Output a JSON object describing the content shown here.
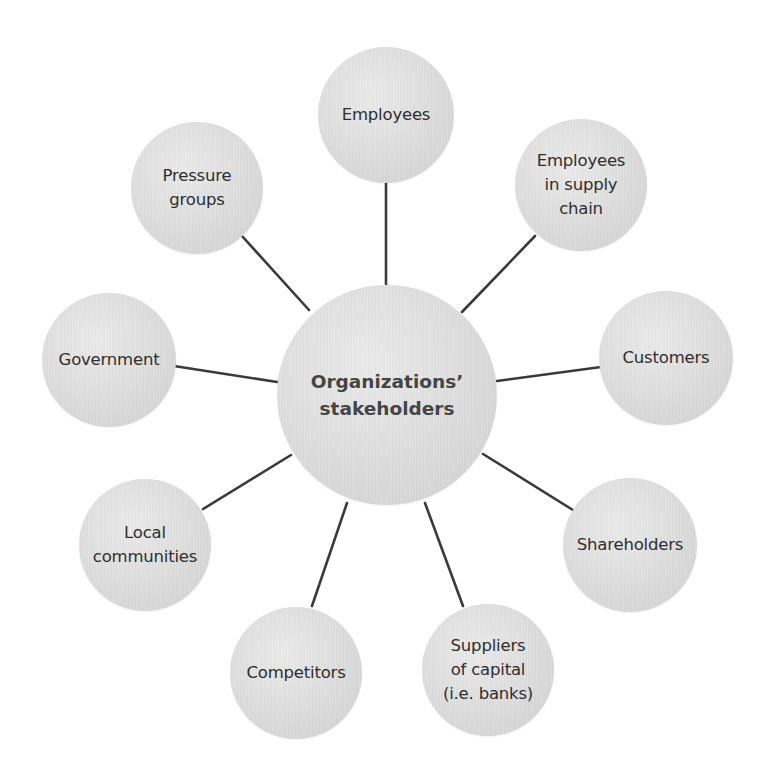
{
  "diagram": {
    "center": {
      "label": "Organizations’\nstakeholders",
      "cx": 387,
      "cy": 395,
      "r": 110
    },
    "nodes": [
      {
        "id": "employees",
        "label": "Employees",
        "cx": 386,
        "cy": 115,
        "r": 68
      },
      {
        "id": "employees-in-supply-chain",
        "label": "Employees\nin supply\nchain",
        "cx": 581,
        "cy": 185,
        "r": 66
      },
      {
        "id": "customers",
        "label": "Customers",
        "cx": 666,
        "cy": 358,
        "r": 67
      },
      {
        "id": "shareholders",
        "label": "Shareholders",
        "cx": 630,
        "cy": 545,
        "r": 67
      },
      {
        "id": "suppliers-of-capital",
        "label": "Suppliers\nof capital\n(i.e. banks)",
        "cx": 488,
        "cy": 670,
        "r": 66
      },
      {
        "id": "competitors",
        "label": "Competitors",
        "cx": 296,
        "cy": 673,
        "r": 66
      },
      {
        "id": "local-communities",
        "label": "Local\ncommunities",
        "cx": 145,
        "cy": 545,
        "r": 66
      },
      {
        "id": "government",
        "label": "Government",
        "cx": 109,
        "cy": 360,
        "r": 67
      },
      {
        "id": "pressure-groups",
        "label": "Pressure\ngroups",
        "cx": 197,
        "cy": 188,
        "r": 66
      }
    ],
    "edges": [
      {
        "to": "employees",
        "x1": 386,
        "y1": 284,
        "x2": 386,
        "y2": 182
      },
      {
        "to": "employees-in-supply-chain",
        "x1": 462,
        "y1": 312,
        "x2": 535,
        "y2": 236
      },
      {
        "to": "customers",
        "x1": 497,
        "y1": 381,
        "x2": 601,
        "y2": 367
      },
      {
        "to": "shareholders",
        "x1": 483,
        "y1": 454,
        "x2": 573,
        "y2": 510
      },
      {
        "to": "suppliers-of-capital",
        "x1": 425,
        "y1": 503,
        "x2": 463,
        "y2": 606
      },
      {
        "to": "competitors",
        "x1": 347,
        "y1": 503,
        "x2": 312,
        "y2": 606
      },
      {
        "to": "local-communities",
        "x1": 291,
        "y1": 455,
        "x2": 203,
        "y2": 509
      },
      {
        "to": "government",
        "x1": 277,
        "y1": 382,
        "x2": 174,
        "y2": 366
      },
      {
        "to": "pressure-groups",
        "x1": 309,
        "y1": 310,
        "x2": 242,
        "y2": 236
      }
    ],
    "colors": {
      "line": "#3a3a3a",
      "circle_fill": "#dedede",
      "text": "#2e2e2e",
      "center_text": "#454545"
    }
  }
}
